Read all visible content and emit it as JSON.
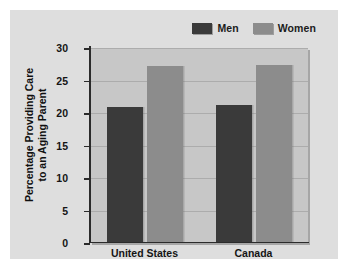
{
  "chart_data": {
    "type": "bar",
    "title": "",
    "xlabel": "",
    "ylabel": "Percentage Providing Care to an Aging Parent",
    "ylabel_line1": "Percentage Providing Care",
    "ylabel_line2": "to an Aging Parent",
    "categories": [
      "United States",
      "Canada"
    ],
    "series": [
      {
        "name": "Men",
        "values": [
          20.9,
          21.2
        ],
        "color": "#3a3a3a"
      },
      {
        "name": "Women",
        "values": [
          27.2,
          27.4
        ],
        "color": "#8c8c8c"
      }
    ],
    "ylim": [
      0,
      30
    ],
    "yticks": [
      0,
      5,
      10,
      15,
      20,
      25,
      30
    ],
    "ytick_labels": [
      "0",
      "5",
      "10",
      "15",
      "20",
      "25",
      "30"
    ],
    "grid": true,
    "legend_position": "top-right",
    "plot_background": "#c7c7c7",
    "figure_background": "#dedede",
    "axis_color": "#2b2b2b"
  }
}
